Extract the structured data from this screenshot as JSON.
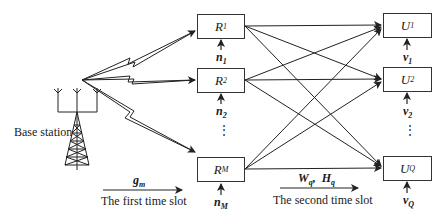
{
  "diagram": {
    "base_station": {
      "label": "Base station"
    },
    "relays": [
      {
        "name": "R",
        "sub": "1",
        "noise": "n",
        "noise_sub": "1"
      },
      {
        "name": "R",
        "sub": "2",
        "noise": "n",
        "noise_sub": "2"
      },
      {
        "name": "R",
        "sub": "M",
        "noise": "n",
        "noise_sub": "M"
      }
    ],
    "users": [
      {
        "name": "U",
        "sub": "1",
        "noise": "v",
        "noise_sub": "1"
      },
      {
        "name": "U",
        "sub": "2",
        "noise": "v",
        "noise_sub": "2"
      },
      {
        "name": "U",
        "sub": "Q",
        "noise": "v",
        "noise_sub": "Q"
      }
    ],
    "ellipsis": "⋮",
    "first_slot": {
      "channel": "g",
      "channel_sub": "m",
      "label": "The first time slot"
    },
    "second_slot": {
      "channel1": "W",
      "channel1_sub": "q",
      "sep": ",",
      "channel2": "H",
      "channel2_sub": "q",
      "label": "The second time slot"
    },
    "colors": {
      "line": "#222222",
      "box_border": "#333333",
      "background": "#ffffff"
    }
  }
}
